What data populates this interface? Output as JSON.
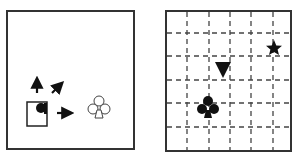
{
  "panels": {
    "left": {
      "description": "Agent in square with movement arrows toward outline club target",
      "agent": {
        "shape": "square-with-dot",
        "x": 27,
        "y": 102,
        "w": 20,
        "h": 24
      },
      "arrows": [
        {
          "name": "up",
          "x1": 37,
          "y1": 92,
          "x2": 37,
          "y2": 78
        },
        {
          "name": "diagonal-up-right",
          "x1": 52,
          "y1": 93,
          "x2": 63,
          "y2": 82
        },
        {
          "name": "right",
          "x1": 57,
          "y1": 113,
          "x2": 72,
          "y2": 113
        }
      ],
      "target": {
        "symbol": "club-outline",
        "glyph": "♧",
        "x": 99,
        "y": 108
      }
    },
    "right": {
      "description": "Dashed 6x6 grid with club, triangle, and star symbols",
      "grid": {
        "cols": 6,
        "rows": 6,
        "dashed": true
      },
      "symbols": [
        {
          "name": "club",
          "glyph": "♣",
          "x": 208,
          "y": 108
        },
        {
          "name": "triangle-down",
          "glyph": "▼",
          "x": 223,
          "y": 68
        },
        {
          "name": "star",
          "glyph": "★",
          "x": 274,
          "y": 48
        }
      ]
    }
  },
  "colors": {
    "ink": "#111111",
    "border": "#333333",
    "dash": "#444444"
  }
}
